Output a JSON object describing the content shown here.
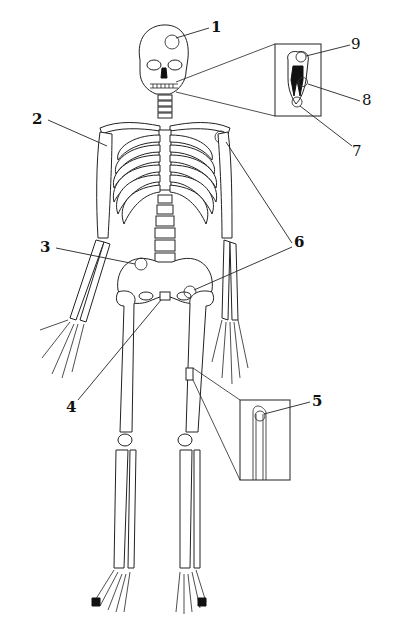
{
  "diagram": {
    "colors": {
      "background": "#ffffff",
      "line": "#222222",
      "label": "#111111"
    },
    "labels": [
      {
        "id": "1",
        "text": "1",
        "x": 211,
        "y": 20,
        "bold": true,
        "target": "skull-cranium-suture"
      },
      {
        "id": "2",
        "text": "2",
        "x": 32,
        "y": 112,
        "bold": true,
        "target": "shoulder-joint-right"
      },
      {
        "id": "3",
        "text": "3",
        "x": 40,
        "y": 240,
        "bold": true,
        "target": "sacroiliac-joint"
      },
      {
        "id": "4",
        "text": "4",
        "x": 66,
        "y": 400,
        "bold": true,
        "target": "pubic-symphysis"
      },
      {
        "id": "5",
        "text": "5",
        "x": 312,
        "y": 394,
        "bold": true,
        "target": "bone-inset-periosteum"
      },
      {
        "id": "6",
        "text": "6",
        "x": 294,
        "y": 235,
        "bold": true,
        "target": "shoulder-and-hip-joints"
      },
      {
        "id": "7",
        "text": "7",
        "x": 352,
        "y": 144,
        "bold": false,
        "target": "tooth-root-apex"
      },
      {
        "id": "8",
        "text": "8",
        "x": 362,
        "y": 93,
        "bold": false,
        "target": "tooth-root-side"
      },
      {
        "id": "9",
        "text": "9",
        "x": 351,
        "y": 37,
        "bold": false,
        "target": "tooth-crown"
      }
    ],
    "insets": [
      {
        "name": "tooth-inset",
        "x": 275,
        "y": 44,
        "w": 46,
        "h": 72
      },
      {
        "name": "bone-inset",
        "x": 240,
        "y": 400,
        "w": 50,
        "h": 80
      }
    ]
  }
}
